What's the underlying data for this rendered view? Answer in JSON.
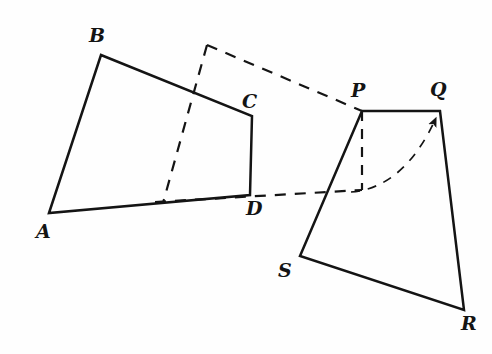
{
  "figure": {
    "kind": "geometry-diagram",
    "canvas": {
      "width": 492,
      "height": 354
    },
    "colors": {
      "background": "#fefefe",
      "stroke": "#141414",
      "dashed_stroke": "#141414",
      "label": "#141414"
    },
    "stroke_widths": {
      "solid": 2.4,
      "dashed": 2.2,
      "arrow": 1.6
    }
  },
  "shapes": {
    "quad_abcd": {
      "name": "ABCD",
      "points": "49,213 101,55 252,116 250,195",
      "closed": true,
      "style": "solid"
    },
    "quad_pqrs": {
      "name": "PQRS",
      "points": "362,111 440,111 464,310 300,256",
      "closed": true,
      "style": "solid"
    }
  },
  "construction": {
    "dashed_top_corner": {
      "x": 207,
      "y": 45
    },
    "dashed_line_corner_to_p": "207,45 362,111",
    "dashed_line_corner_down": "207,45 163,203",
    "dashed_line_d_to_p_foot": "155,202 362,190",
    "dashed_vertical_p": "362,111 362,190",
    "curved_arrow": {
      "from": "355,191",
      "control": "400,185",
      "to": "437,116",
      "arrowhead_at": "437,116"
    }
  },
  "labels": [
    {
      "id": "label-A",
      "text": "A",
      "x": 36,
      "y": 222
    },
    {
      "id": "label-B",
      "text": "B",
      "x": 89,
      "y": 26
    },
    {
      "id": "label-C",
      "text": "C",
      "x": 242,
      "y": 92
    },
    {
      "id": "label-D",
      "text": "D",
      "x": 246,
      "y": 199
    },
    {
      "id": "label-P",
      "text": "P",
      "x": 351,
      "y": 81
    },
    {
      "id": "label-Q",
      "text": "Q",
      "x": 430,
      "y": 80
    },
    {
      "id": "label-R",
      "text": "R",
      "x": 461,
      "y": 314
    },
    {
      "id": "label-S",
      "text": "S",
      "x": 278,
      "y": 261
    }
  ]
}
